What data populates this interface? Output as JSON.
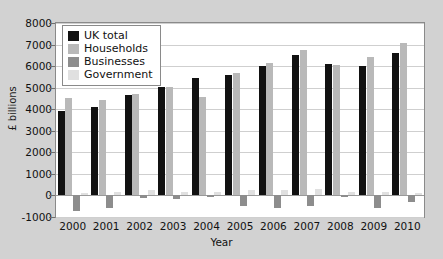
{
  "chart_data": {
    "type": "bar",
    "title": "",
    "xlabel": "Year",
    "ylabel": "£ billions",
    "categories": [
      "2000",
      "2001",
      "2002",
      "2003",
      "2004",
      "2005",
      "2006",
      "2007",
      "2008",
      "2009",
      "2010"
    ],
    "ylim": [
      -1000,
      8000
    ],
    "ytick_labels": [
      "8000",
      "7000",
      "6000",
      "5000",
      "4000",
      "3000",
      "2000",
      "1000",
      "0",
      "-1000"
    ],
    "ytick_values": [
      8000,
      7000,
      6000,
      5000,
      4000,
      3000,
      2000,
      1000,
      0,
      -1000
    ],
    "grid": true,
    "legend_position": "top-left",
    "series": [
      {
        "name": "UK total",
        "color": "#111111",
        "values": [
          3900,
          4080,
          4650,
          5050,
          5450,
          5600,
          6000,
          6500,
          6100,
          6000,
          6600
        ]
      },
      {
        "name": "Households",
        "color": "#b9b9b9",
        "values": [
          4500,
          4450,
          4700,
          5050,
          4580,
          5700,
          6150,
          6750,
          6050,
          6400,
          7050
        ]
      },
      {
        "name": "Businesses",
        "color": "#8d8d8d",
        "values": [
          -700,
          -600,
          -130,
          -180,
          -80,
          -480,
          -560,
          -480,
          -90,
          -600,
          -300
        ]
      },
      {
        "name": "Government",
        "color": "#e0e0e0",
        "values": [
          130,
          180,
          230,
          170,
          180,
          240,
          230,
          280,
          180,
          160,
          110
        ]
      }
    ]
  },
  "legend": {
    "items": [
      {
        "label": "UK total"
      },
      {
        "label": "Households"
      },
      {
        "label": "Businesses"
      },
      {
        "label": "Government"
      }
    ]
  }
}
